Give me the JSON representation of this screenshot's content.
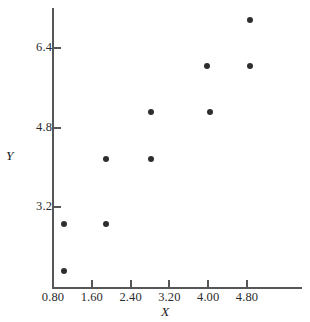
{
  "chart_data": {
    "type": "scatter",
    "title": "",
    "xlabel": "X",
    "ylabel": "Y",
    "xlim": [
      0.45,
      5.6
    ],
    "ylim": [
      1.55,
      7.3
    ],
    "grid": false,
    "legend": null,
    "x_ticks": [
      {
        "label": "0.80",
        "value": 0.8
      },
      {
        "label": "1.60",
        "value": 1.6
      },
      {
        "label": "2.40",
        "value": 2.4
      },
      {
        "label": "3.20",
        "value": 3.2
      },
      {
        "label": "4.00",
        "value": 4.0
      },
      {
        "label": "4.80",
        "value": 4.8
      }
    ],
    "y_ticks": [
      {
        "label": "3.2",
        "value": 3.2
      },
      {
        "label": "4.8",
        "value": 4.8
      },
      {
        "label": "6.4",
        "value": 6.4
      }
    ],
    "points": [
      {
        "x": 1.02,
        "y": 1.91
      },
      {
        "x": 1.02,
        "y": 2.86
      },
      {
        "x": 1.89,
        "y": 2.86
      },
      {
        "x": 1.89,
        "y": 4.17
      },
      {
        "x": 2.82,
        "y": 4.17
      },
      {
        "x": 2.82,
        "y": 5.11
      },
      {
        "x": 3.98,
        "y": 6.04
      },
      {
        "x": 4.04,
        "y": 5.11
      },
      {
        "x": 4.86,
        "y": 6.04
      },
      {
        "x": 4.86,
        "y": 6.97
      }
    ],
    "marker": "filled-circle",
    "marker_color": "#2e2e30",
    "axis_color": "#57575a"
  }
}
